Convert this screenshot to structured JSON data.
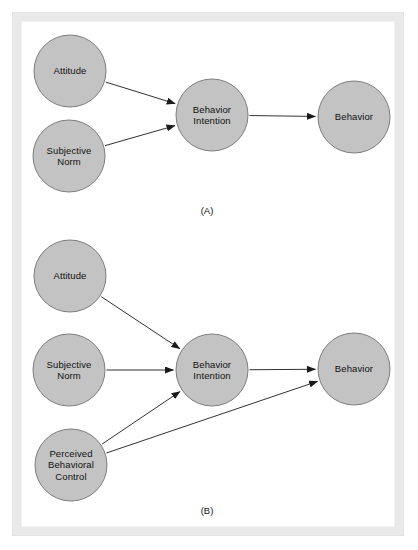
{
  "figure": {
    "background_color": "#ffffff",
    "frame_color": "#e9e9e9",
    "node_fill": "#c3c3c3",
    "node_stroke": "#7d7d7d",
    "arrow_color": "#1a1a1a",
    "text_color": "#111111"
  },
  "panels": [
    {
      "id": "panel-a",
      "caption": "(A)",
      "caption_pos": {
        "x": 207,
        "y": 205
      },
      "nodes": [
        {
          "id": "a-attitude",
          "label": "Attitude",
          "cx": 70,
          "cy": 71,
          "r": 36
        },
        {
          "id": "a-subjective-norm",
          "label": "Subjective\nNorm",
          "cx": 69,
          "cy": 156,
          "r": 36
        },
        {
          "id": "a-behavior-intention",
          "label": "Behavior\nIntention",
          "cx": 212,
          "cy": 115,
          "r": 36
        },
        {
          "id": "a-behavior",
          "label": "Behavior",
          "cx": 354,
          "cy": 117,
          "r": 36
        }
      ],
      "edges": [
        {
          "id": "a-edge-attitude-to-intention",
          "from": "a-attitude",
          "to": "a-behavior-intention"
        },
        {
          "id": "a-edge-norm-to-intention",
          "from": "a-subjective-norm",
          "to": "a-behavior-intention"
        },
        {
          "id": "a-edge-intention-to-behavior",
          "from": "a-behavior-intention",
          "to": "a-behavior"
        }
      ]
    },
    {
      "id": "panel-b",
      "caption": "(B)",
      "caption_pos": {
        "x": 207,
        "y": 505
      },
      "nodes": [
        {
          "id": "b-attitude",
          "label": "Attitude",
          "cx": 70,
          "cy": 276,
          "r": 36
        },
        {
          "id": "b-subjective-norm",
          "label": "Subjective\nNorm",
          "cx": 69,
          "cy": 370,
          "r": 36
        },
        {
          "id": "b-perceived-behavioral-control",
          "label": "Perceived\nBehavioral\nControl",
          "cx": 71,
          "cy": 465,
          "r": 36
        },
        {
          "id": "b-behavior-intention",
          "label": "Behavior\nIntention",
          "cx": 212,
          "cy": 370,
          "r": 36
        },
        {
          "id": "b-behavior",
          "label": "Behavior",
          "cx": 354,
          "cy": 369,
          "r": 36
        }
      ],
      "edges": [
        {
          "id": "b-edge-attitude-to-intention",
          "from": "b-attitude",
          "to": "b-behavior-intention"
        },
        {
          "id": "b-edge-norm-to-intention",
          "from": "b-subjective-norm",
          "to": "b-behavior-intention"
        },
        {
          "id": "b-edge-pbc-to-intention",
          "from": "b-perceived-behavioral-control",
          "to": "b-behavior-intention"
        },
        {
          "id": "b-edge-intention-to-behavior",
          "from": "b-behavior-intention",
          "to": "b-behavior"
        },
        {
          "id": "b-edge-pbc-to-behavior",
          "from": "b-perceived-behavioral-control",
          "to": "b-behavior"
        }
      ]
    }
  ]
}
